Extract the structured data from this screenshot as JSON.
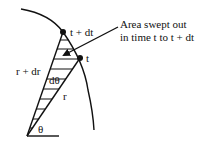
{
  "diagram": {
    "labels": {
      "point_later": "t + dt",
      "point_earlier": "t",
      "radius_outer": "r + dr",
      "radius_inner": "r",
      "angle_increment": "dθ",
      "angle": "θ"
    },
    "callout": {
      "line1": "Area swept out",
      "line2": "in time t to t + dt"
    },
    "colors": {
      "stroke": "#111111",
      "background": "#ffffff"
    }
  }
}
